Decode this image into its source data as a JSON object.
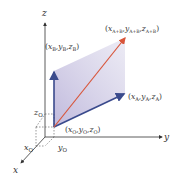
{
  "diagram": {
    "axes": {
      "x": "x",
      "y": "y",
      "z": "z"
    },
    "origin_ticks": {
      "x0": "x",
      "x0_sub": "O",
      "y0": "y",
      "y0_sub": "O",
      "z0": "z",
      "z0_sub": "O"
    },
    "points": {
      "O": {
        "label": "(x_O, y_O, z_O)",
        "x": "x",
        "y": "y",
        "z": "z",
        "sub": "O"
      },
      "A": {
        "label": "(x_A, y_A, z_A)",
        "x": "x",
        "y": "y",
        "z": "z",
        "sub": "A"
      },
      "B": {
        "label": "(x_B, y_B, z_B)",
        "x": "x",
        "y": "y",
        "z": "z",
        "sub": "B"
      },
      "AB": {
        "label": "(x_A+B, y_A+B, z_A+B)",
        "x": "x",
        "y": "y",
        "z": "z",
        "sub": "A+B"
      }
    },
    "colors": {
      "vector_a": "#3a4a8c",
      "vector_b": "#3a4a8c",
      "vector_sum": "#d8553a",
      "parallelogram": "#c9c4e0",
      "axis": "#333333"
    },
    "punct": {
      "open": "(",
      "comma": ",",
      "close": ")"
    }
  }
}
